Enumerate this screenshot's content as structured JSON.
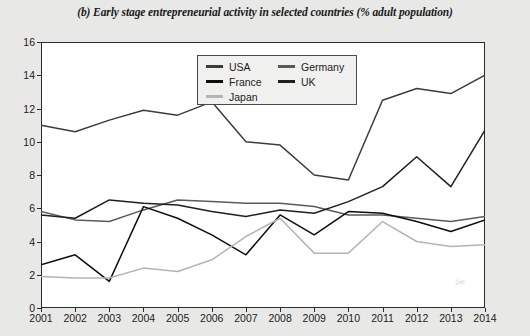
{
  "chart_data": {
    "type": "line",
    "title": "(b) Early stage entrepreneurial activity in selected countries (% adult population)",
    "xlabel": "",
    "ylabel": "",
    "x": [
      2001,
      2002,
      2003,
      2004,
      2005,
      2006,
      2007,
      2008,
      2009,
      2010,
      2011,
      2012,
      2013,
      2014
    ],
    "categories": [
      "2001",
      "2002",
      "2003",
      "2004",
      "2005",
      "2006",
      "2007",
      "2008",
      "2009",
      "2010",
      "2011",
      "2012",
      "2013",
      "2014"
    ],
    "ylim": [
      0,
      16
    ],
    "yticks": [
      0,
      2,
      4,
      6,
      8,
      10,
      12,
      14,
      16
    ],
    "grid": false,
    "legend_position": "top-center",
    "series": [
      {
        "name": "USA",
        "color": "#3c3c3c",
        "values": [
          11.0,
          10.6,
          11.3,
          11.9,
          11.6,
          12.4,
          10.0,
          9.8,
          8.0,
          7.7,
          12.5,
          13.2,
          12.9,
          14.0
        ]
      },
      {
        "name": "Germany",
        "color": "#5a5a5a",
        "values": [
          5.8,
          5.3,
          5.2,
          5.9,
          6.5,
          6.4,
          6.3,
          6.3,
          6.1,
          5.6,
          5.6,
          5.4,
          5.2,
          5.5
        ]
      },
      {
        "name": "France",
        "color": "#0d0d0d",
        "values": [
          2.6,
          3.2,
          1.6,
          6.1,
          5.4,
          4.4,
          3.2,
          5.6,
          4.4,
          5.8,
          5.7,
          5.2,
          4.6,
          5.3
        ]
      },
      {
        "name": "UK",
        "color": "#1f1f1f",
        "values": [
          5.6,
          5.4,
          6.5,
          6.3,
          6.2,
          5.8,
          5.5,
          5.9,
          5.7,
          6.4,
          7.3,
          9.1,
          7.3,
          10.7
        ]
      },
      {
        "name": "Japan",
        "color": "#b4b4b4",
        "values": [
          1.9,
          1.8,
          1.8,
          2.4,
          2.2,
          2.9,
          4.3,
          5.4,
          3.3,
          3.3,
          5.2,
          4.0,
          3.7,
          3.8
        ]
      }
    ],
    "legend_columns": [
      [
        "USA",
        "France",
        "Japan"
      ],
      [
        "Germany",
        "UK"
      ]
    ]
  },
  "watermark": "✂"
}
